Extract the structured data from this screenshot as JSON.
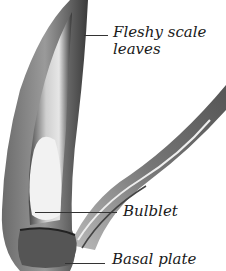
{
  "figure": {
    "labels": [
      {
        "id": "fleshy",
        "line1": "Fleshy scale",
        "line2": "leaves"
      },
      {
        "id": "bulblet",
        "line1": "Bulblet"
      },
      {
        "id": "basal",
        "line1": "Basal plate"
      }
    ],
    "colors": {
      "ink": "#1a1a1a",
      "leader": "#333333",
      "background": "#ffffff"
    }
  }
}
